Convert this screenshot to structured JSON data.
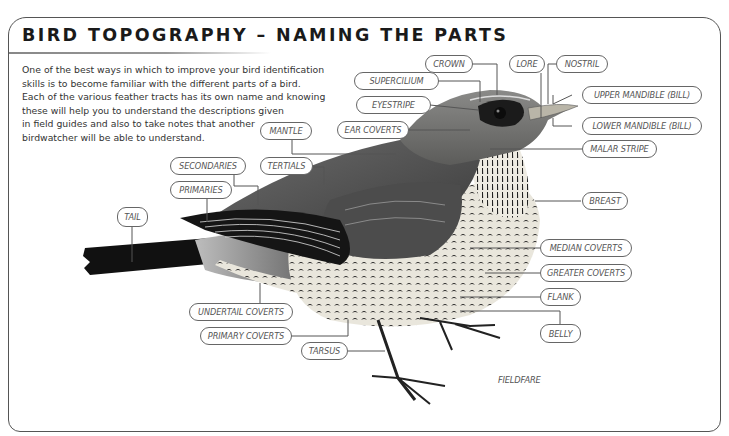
{
  "title": "BIRD TOPOGRAPHY – NAMING THE PARTS",
  "intro_lines": [
    "One of the best ways in which to improve your bird identification",
    "skills is to become familiar with the different parts of a bird.",
    "Each of the various feather tracts has its own name and knowing",
    "these will help you to understand the descriptions given",
    "in field guides and also to take notes that another",
    "birdwatcher will be able to understand."
  ],
  "species": "FIELDFARE",
  "labels": {
    "crown": "CROWN",
    "lore": "LORE",
    "nostril": "NOSTRIL",
    "supercilium": "SUPERCILIUM",
    "eyestripe": "EYESTRIPE",
    "ear_coverts": "EAR COVERTS",
    "mantle": "MANTLE",
    "upper_mandible": "UPPER MANDIBLE (BILL)",
    "lower_mandible": "LOWER MANDIBLE (BILL)",
    "malar_stripe": "MALAR STRIPE",
    "secondaries": "SECONDARIES",
    "tertials": "TERTIALS",
    "primaries": "PRIMARIES",
    "tail": "TAIL",
    "breast": "BREAST",
    "median_coverts": "MEDIAN COVERTS",
    "greater_coverts": "GREATER COVERTS",
    "flank": "FLANK",
    "undertail_coverts": "UNDERTAIL COVERTS",
    "primary_coverts": "PRIMARY COVERTS",
    "tarsus": "TARSUS",
    "belly": "BELLY"
  }
}
